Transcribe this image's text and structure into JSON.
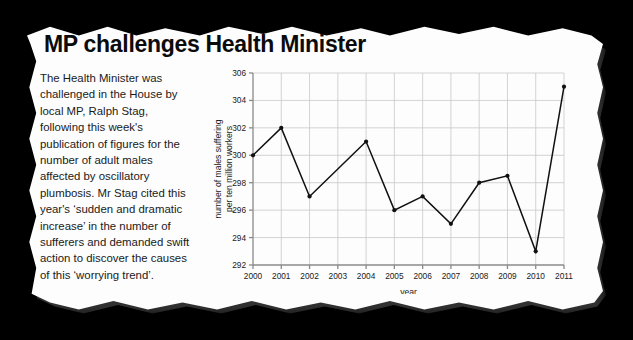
{
  "article": {
    "headline": "MP challenges Health Minister",
    "body": "The Health Minister was challenged in the House by local MP, Ralph Stag, following this week's publication of figures for the number of adult males affected by oscillatory plumbosis. Mr Stag cited this year's ‘sudden and dramatic increase’ in the number of sufferers and demanded swift action to discover the causes of this ‘worrying trend’."
  },
  "chart_data": {
    "type": "line",
    "title": "",
    "xlabel": "year",
    "ylabel": "number of males suffering per ten million workers",
    "ylabel_lines": [
      "number of males suffering",
      "per ten million workers"
    ],
    "categories": [
      2000,
      2001,
      2002,
      2003,
      2004,
      2005,
      2006,
      2007,
      2008,
      2009,
      2010,
      2011
    ],
    "x_tick_labels": [
      "2000",
      "2001",
      "2002",
      "2003",
      "2004",
      "2005",
      "2006",
      "2007",
      "2008",
      "2009",
      "2010",
      "2011"
    ],
    "values": [
      300,
      302,
      297,
      299,
      301,
      296,
      297,
      295,
      298,
      298.5,
      293,
      305
    ],
    "y_tick_labels": [
      "292",
      "294",
      "296",
      "298",
      "300",
      "302",
      "304",
      "306"
    ],
    "y_ticks": [
      292,
      294,
      296,
      298,
      300,
      302,
      304,
      306
    ],
    "ylim": [
      292,
      306
    ],
    "xlim": [
      2000,
      2011
    ],
    "grid": true,
    "legend": "none",
    "line_color": "#111111",
    "marker": "circle",
    "grid_color": "#c8c8c8",
    "axis_color": "#8a8a8a"
  },
  "style": {
    "background_color": "#000000",
    "paper_color": "#fdfdfd",
    "text_color": "#1a1a1a"
  }
}
